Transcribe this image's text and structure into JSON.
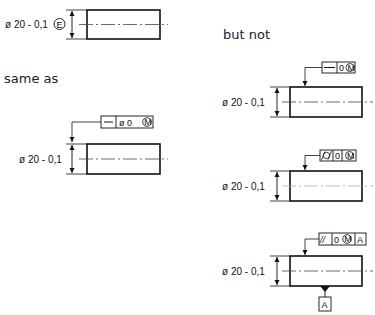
{
  "labels": {
    "same_as": "same as",
    "but_not": "but not"
  },
  "diagrams": [
    {
      "id": "envelope",
      "dimension": "ø 20 - 0,1",
      "modifier": "E",
      "fcf": null
    },
    {
      "id": "same-as",
      "dimension": "ø 20 - 0,1",
      "fcf": {
        "cells": [
          "—",
          "ø 0 Ⓜ"
        ],
        "symbol": "straightness",
        "tolerance": "ø 0",
        "modifier": "M"
      }
    },
    {
      "id": "but-not-1",
      "dimension": "ø 20 - 0,1",
      "fcf": {
        "cells": [
          "—",
          "0 Ⓜ"
        ],
        "symbol": "straightness",
        "tolerance": "0",
        "modifier": "M"
      }
    },
    {
      "id": "but-not-2",
      "dimension": "ø 20 - 0,1",
      "fcf": {
        "cells": [
          "⌭",
          "0",
          "Ⓜ"
        ],
        "symbol": "cylindricity",
        "tolerance": "0",
        "modifier": "M"
      }
    },
    {
      "id": "but-not-3",
      "dimension": "ø 20 - 0,1",
      "fcf": {
        "cells": [
          "//",
          "0 Ⓜ",
          "A"
        ],
        "symbol": "parallelism",
        "tolerance": "0",
        "modifier": "M",
        "datum": "A"
      },
      "datum_label": "A"
    }
  ],
  "text": {
    "d1_dim": "ø 20 - 0,1",
    "d1_mod": "E",
    "d2_dim": "ø 20 - 0,1",
    "d2_tol": "ø 0",
    "d2_mod": "M",
    "d3_dim": "ø 20 - 0,1",
    "d3_tol": "0",
    "d3_mod": "M",
    "d4_dim": "ø 20 - 0,1",
    "d4_tol": "0",
    "d4_mod": "M",
    "d5_dim": "ø 20 - 0,1",
    "d5_sym": "//",
    "d5_tol": "0",
    "d5_mod": "M",
    "d5_datum_ref": "A",
    "d5_datum": "A"
  },
  "colors": {
    "line": "#111111",
    "centerline": "#555555",
    "text": "#222222"
  }
}
